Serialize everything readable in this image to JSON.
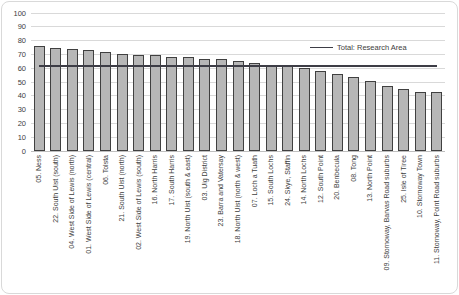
{
  "chart_data": {
    "type": "bar",
    "title": "",
    "categories": [
      "05. Ness",
      "22. South Uist (south)",
      "04. West Side of Lewis (north)",
      "01. West Side of Lewis (central)",
      "06. Tolsta",
      "21. South Uist (north)",
      "02. West Side of Lewis (south)",
      "16. North Harris",
      "17. South Harris",
      "19. North Uist (south & east)",
      "03. Uig District",
      "23. Barra and Vatersay",
      "18. North Uist (north & west)",
      "07. Loch a Tuath",
      "15. South Lochs",
      "24. Skye, Staffin",
      "14. North Lochs",
      "12. South Point",
      "20. Benbecula",
      "08. Tong",
      "13. North Point",
      "09. Stornoway, Barvas Road suburbs",
      "25. Isle of Tiree",
      "10. Stornoway Town",
      "11. Stornoway, Point Road suburbs"
    ],
    "values": [
      76,
      75,
      74,
      73,
      71.5,
      70,
      69.5,
      69.5,
      68,
      68,
      67,
      67,
      65.5,
      64,
      62,
      62,
      60.5,
      58,
      56,
      53.5,
      51,
      47,
      45,
      43,
      42.5
    ],
    "ylim": [
      0,
      100
    ],
    "yticks": [
      0,
      10,
      20,
      30,
      40,
      50,
      60,
      70,
      80,
      90,
      100
    ],
    "xlabel": "",
    "ylabel": "",
    "grid": "horizontal",
    "legend_label": "Total: Research Area",
    "legend_position": "inside-top-right",
    "reference_line": {
      "label": "Total: Research Area",
      "value": 61.5
    },
    "colors": {
      "bar_fill": "#b7b7b7",
      "bar_border": "#404040",
      "reference_line": "#3d3d46",
      "gridline": "#d9d9d9",
      "axis_line": "#bfbfbf",
      "text": "#404040",
      "frame_border": "#d9d9d9",
      "background": "#ffffff"
    }
  }
}
